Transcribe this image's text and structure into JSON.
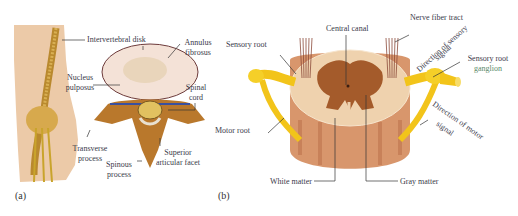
{
  "figure": {
    "panels": [
      {
        "id": "a",
        "caption": "(a)",
        "labels": {
          "intervertebral_disk": "Intervertebral disk",
          "annulus_fibrosus_1": "Annulus",
          "annulus_fibrosus_2": "fibrosus",
          "nucleus_pulposus_1": "Nucleus",
          "nucleus_pulposus_2": "pulposus",
          "spinal_cord_1": "Spinal",
          "spinal_cord_2": "cord",
          "transverse_process_1": "Transverse",
          "transverse_process_2": "process",
          "spinous_process_1": "Spinous",
          "spinous_process_2": "process",
          "superior_articular_facet_1": "Superior",
          "superior_articular_facet_2": "articular facet"
        }
      },
      {
        "id": "b",
        "caption": "(b)",
        "labels": {
          "central_canal": "Central canal",
          "nerve_fiber_tract": "Nerve fiber tract",
          "sensory_root": "Sensory root",
          "direction_sensory_1": "Direction of sensory",
          "direction_sensory_2": "signal",
          "sensory_root_ganglion_1": "Sensory root",
          "sensory_root_ganglion_2": "ganglion",
          "motor_root": "Motor root",
          "direction_motor_1": "Direction of motor",
          "direction_motor_2": "signal",
          "white_matter": "White matter",
          "gray_matter": "Gray matter"
        }
      }
    ],
    "colors": {
      "skin": "#ecc9a6",
      "bone": "#c8872e",
      "nerve_yellow": "#f2c41a",
      "disk": "#f4e1d6",
      "white_matter": "#efd1ad",
      "gray_matter": "#a25a2c",
      "cord_side": "#d6936a",
      "label_text": "#3a3a4a",
      "green_text": "#5a8a6a"
    }
  }
}
